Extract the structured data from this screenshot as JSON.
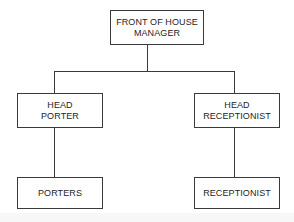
{
  "diagram": {
    "type": "org-chart",
    "root": {
      "id": "front_of_house_manager",
      "label_lines": [
        "FRONT OF HOUSE",
        "MANAGER"
      ],
      "children": [
        "head_porter",
        "head_receptionist"
      ]
    },
    "nodes": {
      "head_porter": {
        "label_lines": [
          "HEAD",
          "PORTER"
        ],
        "children": [
          "porters"
        ]
      },
      "head_receptionist": {
        "label_lines": [
          "HEAD",
          "RECEPTIONIST"
        ],
        "children": [
          "receptionist"
        ]
      },
      "porters": {
        "label_lines": [
          "PORTERS"
        ],
        "children": []
      },
      "receptionist": {
        "label_lines": [
          "RECEPTIONIST"
        ],
        "children": []
      }
    },
    "colors": {
      "line": "#3a3a3a",
      "text": "#1e1e1e",
      "background": "#ffffff"
    }
  }
}
